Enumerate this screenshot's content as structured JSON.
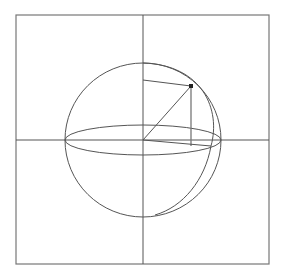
{
  "diagram": {
    "title": "",
    "colors": {
      "background": "#ffffff",
      "stroke": "#555555",
      "frame": "#777777",
      "point": "#222222"
    },
    "frame": {
      "x": 16,
      "y": 15,
      "width": 253,
      "height": 249
    },
    "axes": {
      "horizontal_y": 140,
      "vertical_x": 143
    },
    "sphere": {
      "cx": 143,
      "cy": 140,
      "rx": 78,
      "ry": 77
    },
    "equator": {
      "cx": 143,
      "cy": 140,
      "rx": 78,
      "ry": 15
    },
    "point": {
      "x": 191,
      "y": 86,
      "label": ""
    },
    "projection": {
      "foot": {
        "x": 191,
        "y": 146
      },
      "axis_mark": {
        "x": 143,
        "y": 80
      }
    },
    "labels": []
  }
}
